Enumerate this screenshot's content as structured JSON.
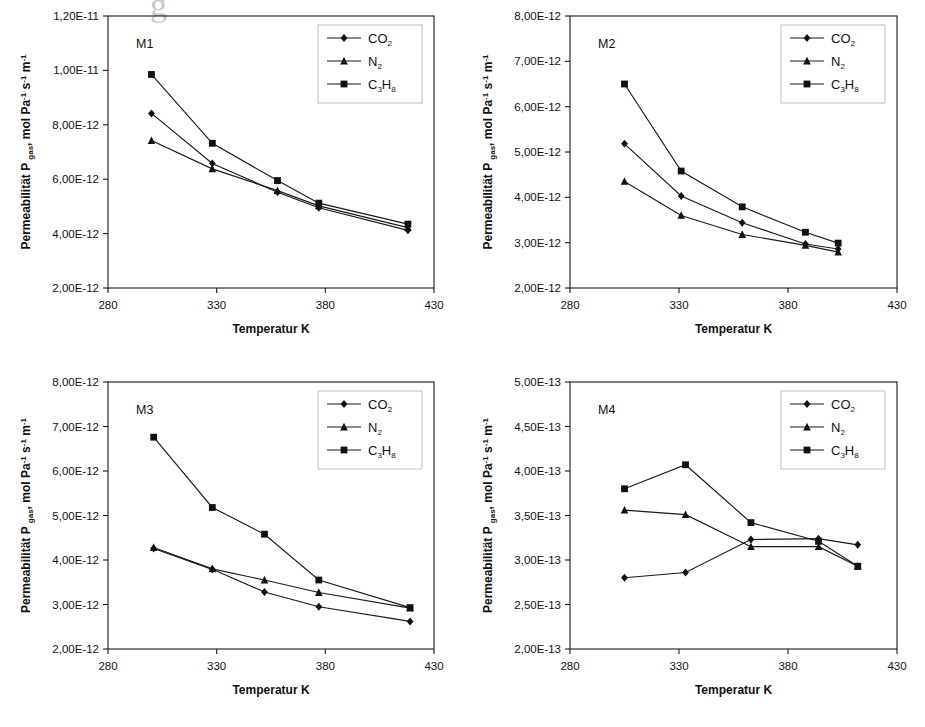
{
  "figure": {
    "scan_artifact_text": "g",
    "axis": {
      "xlabel": "Temperatur K",
      "ylabel_prefix": "Permeabilität P",
      "ylabel_sub": "gas",
      "ylabel_suffix": ", mol Pa",
      "ylabel_unit_tail": " s",
      "ylabel_unit_tail2": " m",
      "exp_minus_one": "-1",
      "xticks": [
        "280",
        "330",
        "380",
        "430"
      ],
      "xlim": [
        280,
        430
      ]
    },
    "legend": {
      "items": [
        {
          "label": "CO",
          "sub": "2",
          "marker": "diamond",
          "name": "co2"
        },
        {
          "label": "N",
          "sub": "2",
          "marker": "triangle",
          "name": "n2"
        },
        {
          "label": "C",
          "sub": "3",
          "label2": "H",
          "sub2": "8",
          "marker": "square",
          "name": "c3h8"
        }
      ]
    }
  },
  "chart_data": [
    {
      "type": "line",
      "title": "M1",
      "xlabel": "Temperatur K",
      "ylabel": "Permeabilität P gas, mol Pa-1 s-1 m-1",
      "xlim": [
        280,
        430
      ],
      "ylim": [
        2e-12,
        1.2e-11
      ],
      "xticks": [
        280,
        330,
        380,
        430
      ],
      "yticks": [
        2e-12,
        4e-12,
        6e-12,
        8e-12,
        1e-11,
        1.2e-11
      ],
      "ytick_labels": [
        "2,00E-12",
        "4,00E-12",
        "6,00E-12",
        "8,00E-12",
        "1,00E-11",
        "1,20E-11"
      ],
      "grid": false,
      "legend_position": "top-right",
      "x": [
        300,
        328,
        358,
        377,
        418
      ],
      "series": [
        {
          "name": "CO2",
          "marker": "diamond",
          "values": [
            8.42e-12,
            6.58e-12,
            5.52e-12,
            4.95e-12,
            4.12e-12
          ]
        },
        {
          "name": "N2",
          "marker": "triangle",
          "values": [
            7.42e-12,
            6.38e-12,
            5.58e-12,
            5.02e-12,
            4.22e-12
          ]
        },
        {
          "name": "C3H8",
          "marker": "square",
          "values": [
            9.85e-12,
            7.32e-12,
            5.95e-12,
            5.12e-12,
            4.35e-12
          ]
        }
      ]
    },
    {
      "type": "line",
      "title": "M2",
      "xlabel": "Temperatur K",
      "ylabel": "Permeabilität P gas, mol Pa-1 s-1 m-1",
      "xlim": [
        280,
        430
      ],
      "ylim": [
        2e-12,
        8e-12
      ],
      "xticks": [
        280,
        330,
        380,
        430
      ],
      "yticks": [
        2e-12,
        3e-12,
        4e-12,
        5e-12,
        6e-12,
        7e-12,
        8e-12
      ],
      "ytick_labels": [
        "2,00E-12",
        "3,00E-12",
        "4,00E-12",
        "5,00E-12",
        "6,00E-12",
        "7,00E-12",
        "8,00E-12"
      ],
      "grid": false,
      "legend_position": "top-right",
      "x": [
        305,
        331,
        359,
        388,
        403
      ],
      "series": [
        {
          "name": "CO2",
          "marker": "diamond",
          "values": [
            5.18e-12,
            4.03e-12,
            3.44e-12,
            2.97e-12,
            2.86e-12
          ]
        },
        {
          "name": "N2",
          "marker": "triangle",
          "values": [
            4.35e-12,
            3.6e-12,
            3.18e-12,
            2.94e-12,
            2.79e-12
          ]
        },
        {
          "name": "C3H8",
          "marker": "square",
          "values": [
            6.5e-12,
            4.58e-12,
            3.79e-12,
            3.23e-12,
            2.99e-12
          ]
        }
      ]
    },
    {
      "type": "line",
      "title": "M3",
      "xlabel": "Temperatur K",
      "ylabel": "Permeabilität P gas, mol Pa-1 s-1 m-1",
      "xlim": [
        280,
        430
      ],
      "ylim": [
        2e-12,
        8e-12
      ],
      "xticks": [
        280,
        330,
        380,
        430
      ],
      "yticks": [
        2e-12,
        3e-12,
        4e-12,
        5e-12,
        6e-12,
        7e-12,
        8e-12
      ],
      "ytick_labels": [
        "2,00E-12",
        "3,00E-12",
        "4,00E-12",
        "5,00E-12",
        "6,00E-12",
        "7,00E-12",
        "8,00E-12"
      ],
      "grid": false,
      "legend_position": "top-right",
      "x": [
        301,
        328,
        352,
        377,
        419
      ],
      "series": [
        {
          "name": "CO2",
          "marker": "diamond",
          "values": [
            4.26e-12,
            3.79e-12,
            3.28e-12,
            2.95e-12,
            2.62e-12
          ]
        },
        {
          "name": "N2",
          "marker": "triangle",
          "values": [
            4.28e-12,
            3.8e-12,
            3.55e-12,
            3.27e-12,
            2.92e-12
          ]
        },
        {
          "name": "C3H8",
          "marker": "square",
          "values": [
            6.76e-12,
            5.18e-12,
            4.58e-12,
            3.55e-12,
            2.93e-12
          ]
        }
      ]
    },
    {
      "type": "line",
      "title": "M4",
      "xlabel": "Temperatur K",
      "ylabel": "Permeabilität P gas, mol Pa-1 s-1 m-1",
      "xlim": [
        280,
        430
      ],
      "ylim": [
        2e-13,
        5e-13
      ],
      "xticks": [
        280,
        330,
        380,
        430
      ],
      "yticks": [
        2e-13,
        2.5e-13,
        3e-13,
        3.5e-13,
        4e-13,
        4.5e-13,
        5e-13
      ],
      "ytick_labels": [
        "2,00E-13",
        "2,50E-13",
        "3,00E-13",
        "3,50E-13",
        "4,00E-13",
        "4,50E-13",
        "5,00E-13"
      ],
      "grid": false,
      "legend_position": "top-right",
      "x": [
        305,
        333,
        363,
        394,
        412
      ],
      "series": [
        {
          "name": "CO2",
          "marker": "diamond",
          "values": [
            2.8e-13,
            2.86e-13,
            3.23e-13,
            3.24e-13,
            3.17e-13
          ]
        },
        {
          "name": "N2",
          "marker": "triangle",
          "values": [
            3.56e-13,
            3.51e-13,
            3.15e-13,
            3.15e-13,
            2.93e-13
          ]
        },
        {
          "name": "C3H8",
          "marker": "square",
          "values": [
            3.8e-13,
            4.07e-13,
            3.42e-13,
            3.21e-13,
            2.93e-13
          ]
        }
      ]
    }
  ]
}
